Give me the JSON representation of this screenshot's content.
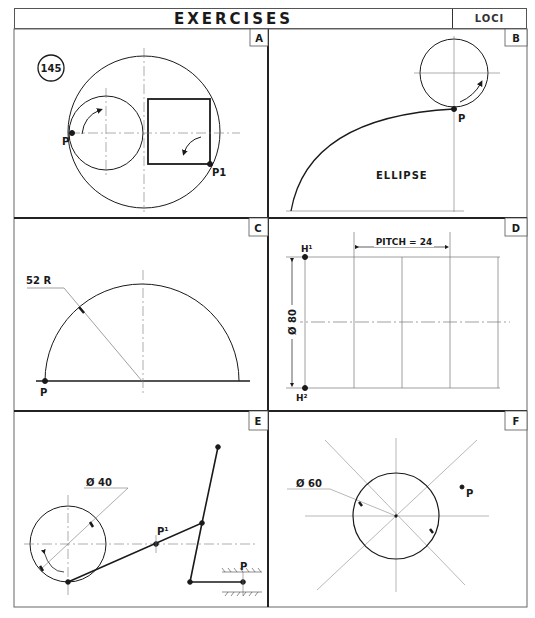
{
  "header": {
    "title": "EXERCISES",
    "topic": "LOCI",
    "exercise_number": "145"
  },
  "panels": [
    {
      "id": "A",
      "labels": {
        "start_point": "P",
        "end_point": "P1"
      },
      "description": "Small circle and square rolling inside a large circle"
    },
    {
      "id": "B",
      "labels": {
        "point": "P",
        "caption": "ELLIPSE"
      },
      "description": "Circle rolling with point P tracing a curve"
    },
    {
      "id": "C",
      "labels": {
        "radius": "52 R",
        "point": "P"
      },
      "description": "Semicircle of radius 52 with point P on base"
    },
    {
      "id": "D",
      "labels": {
        "pitch": "PITCH = 24",
        "diameter": "Ø 80",
        "top": "H¹",
        "bottom": "H²"
      },
      "description": "Helix grid, pitch 24, diameter 80"
    },
    {
      "id": "E",
      "labels": {
        "diameter": "Ø 40",
        "midpoint": "P¹",
        "point": "P"
      },
      "description": "Crank and link mechanism with slider P"
    },
    {
      "id": "F",
      "labels": {
        "diameter": "Ø 60",
        "point": "P"
      },
      "description": "Circle of diameter 60 with radial lines and external point P"
    }
  ]
}
